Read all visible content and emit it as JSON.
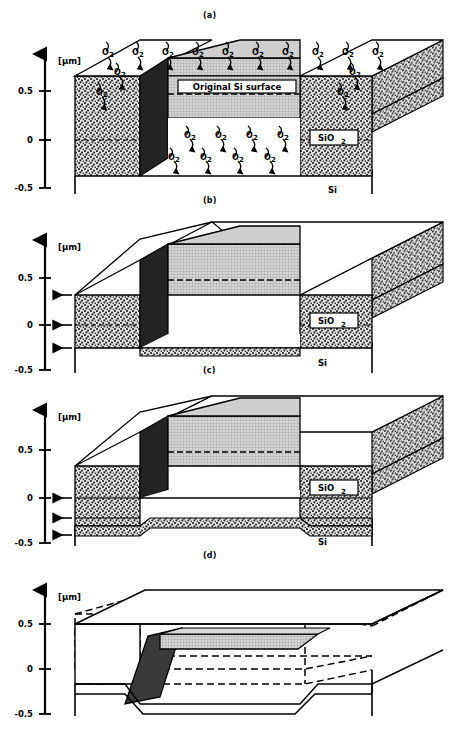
{
  "figure": {
    "unit_label": "[µm]",
    "axis_ticks": [
      "0.5",
      "0",
      "-0.5"
    ],
    "panels": [
      {
        "id": "a",
        "label": "(a)",
        "materials": {
          "oxide": "SiO",
          "oxide_sub": "2",
          "substrate": "Si"
        },
        "annotation": "Original Si surface",
        "gas_label": "O",
        "gas_sub": "2",
        "gas_top_count": 10,
        "gas_side_count": 3,
        "gas_cavity_count": 8
      },
      {
        "id": "b",
        "label": "(b)",
        "materials": {
          "oxide": "SiO",
          "oxide_sub": "2",
          "substrate": "Si"
        },
        "boundary_arrows": 3
      },
      {
        "id": "c",
        "label": "(c)",
        "materials": {
          "oxide": "SiO",
          "oxide_sub": "2",
          "substrate": "Si"
        },
        "boundary_arrows": 3
      },
      {
        "id": "d",
        "label": "(d)",
        "materials": {}
      }
    ],
    "colors": {
      "line": "#000000",
      "oxide_fill": "#d8d8d8",
      "grid_fill": "#cfcfcf",
      "dark_face": "#232323",
      "background": "#ffffff"
    }
  }
}
